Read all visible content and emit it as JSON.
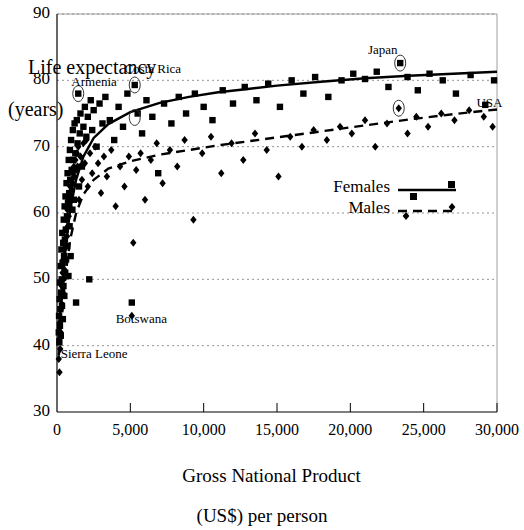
{
  "chart_data": {
    "type": "scatter",
    "title": "",
    "xlabel": "Gross National Product (US$) per person",
    "xlabel_line1": "Gross National Product",
    "xlabel_line2": "(US$) per person",
    "ylabel": "Life expectancy (years)",
    "ylabel_line1": "Life expectancy",
    "ylabel_line2": "(years)",
    "xlim": [
      0,
      30000
    ],
    "ylim": [
      30,
      90
    ],
    "xticks": [
      0,
      5000,
      10000,
      15000,
      20000,
      25000,
      30000
    ],
    "xtick_labels": [
      "0",
      "5,000",
      "10,000",
      "15,000",
      "20,000",
      "25,000",
      "30,000"
    ],
    "yticks": [
      30,
      40,
      50,
      60,
      70,
      80,
      90
    ],
    "ytick_labels": [
      "30",
      "40",
      "50",
      "60",
      "70",
      "80",
      "90"
    ],
    "grid": true,
    "grid_style": "dotted-horizontal",
    "legend_position": "center-right",
    "legend": [
      {
        "name": "Females",
        "marker": "square",
        "line": "solid"
      },
      {
        "name": "Males",
        "marker": "diamond",
        "line": "dashed"
      }
    ],
    "annotations": [
      {
        "label": "Armenia",
        "x": 1450,
        "y": 78.0,
        "circled": true,
        "label_x": 980,
        "label_y": 79.6
      },
      {
        "label": "Costa Rica",
        "x": 5300,
        "y": 79.3,
        "circled": true,
        "label_x": 4600,
        "label_y": 81.6
      },
      {
        "label": "Japan",
        "x": 23400,
        "y": 82.6,
        "circled": true,
        "label_x": 21200,
        "label_y": 84.4
      },
      {
        "label": "USA",
        "x": 29800,
        "y": 76.3,
        "circled": false,
        "label_x": 28600,
        "label_y": 76.5
      },
      {
        "label": "Botswana",
        "x": 5100,
        "y": 46.5,
        "circled": false,
        "label_x": 4000,
        "label_y": 43.8
      },
      {
        "label": "Sierra Leone",
        "x": 300,
        "y": 36.0,
        "circled": false,
        "label_x": 250,
        "label_y": 38.6
      }
    ],
    "series": [
      {
        "name": "Females",
        "marker": "square",
        "line": "solid",
        "color": "#000000",
        "trend": [
          [
            120,
            42.0
          ],
          [
            300,
            47.5
          ],
          [
            600,
            55.0
          ],
          [
            900,
            60.5
          ],
          [
            1300,
            65.0
          ],
          [
            1800,
            68.5
          ],
          [
            2500,
            71.3
          ],
          [
            3500,
            73.4
          ],
          [
            5000,
            75.2
          ],
          [
            7000,
            76.6
          ],
          [
            9000,
            77.5
          ],
          [
            11000,
            78.2
          ],
          [
            13000,
            78.7
          ],
          [
            15000,
            79.2
          ],
          [
            18000,
            79.8
          ],
          [
            21000,
            80.3
          ],
          [
            24000,
            80.7
          ],
          [
            27000,
            81.0
          ],
          [
            30000,
            81.3
          ]
        ],
        "points": [
          [
            120,
            42.0
          ],
          [
            140,
            44.5
          ],
          [
            160,
            40.5
          ],
          [
            180,
            47.0
          ],
          [
            200,
            43.0
          ],
          [
            210,
            49.5
          ],
          [
            230,
            45.5
          ],
          [
            250,
            52.0
          ],
          [
            260,
            41.5
          ],
          [
            280,
            48.0
          ],
          [
            300,
            54.5
          ],
          [
            320,
            50.0
          ],
          [
            340,
            46.0
          ],
          [
            360,
            57.0
          ],
          [
            380,
            52.5
          ],
          [
            400,
            44.0
          ],
          [
            420,
            55.5
          ],
          [
            440,
            49.0
          ],
          [
            460,
            59.0
          ],
          [
            480,
            53.5
          ],
          [
            500,
            47.5
          ],
          [
            520,
            61.0
          ],
          [
            540,
            56.0
          ],
          [
            560,
            51.0
          ],
          [
            580,
            62.5
          ],
          [
            600,
            57.5
          ],
          [
            620,
            53.0
          ],
          [
            650,
            64.5
          ],
          [
            680,
            59.5
          ],
          [
            700,
            55.0
          ],
          [
            720,
            66.0
          ],
          [
            750,
            61.5
          ],
          [
            780,
            50.5
          ],
          [
            800,
            68.0
          ],
          [
            830,
            63.0
          ],
          [
            860,
            58.0
          ],
          [
            880,
            69.5
          ],
          [
            900,
            65.0
          ],
          [
            930,
            53.5
          ],
          [
            960,
            71.0
          ],
          [
            1000,
            66.5
          ],
          [
            1050,
            60.5
          ],
          [
            1080,
            72.5
          ],
          [
            1100,
            68.0
          ],
          [
            1150,
            62.0
          ],
          [
            1200,
            73.5
          ],
          [
            1250,
            69.0
          ],
          [
            1300,
            46.5
          ],
          [
            1350,
            74.0
          ],
          [
            1400,
            70.5
          ],
          [
            1450,
            78.0
          ],
          [
            1500,
            64.0
          ],
          [
            1550,
            72.0
          ],
          [
            1600,
            75.0
          ],
          [
            1700,
            67.0
          ],
          [
            1800,
            73.0
          ],
          [
            1900,
            76.0
          ],
          [
            2000,
            71.5
          ],
          [
            2100,
            74.5
          ],
          [
            2200,
            50.0
          ],
          [
            2300,
            77.0
          ],
          [
            2400,
            72.5
          ],
          [
            2500,
            75.5
          ],
          [
            2700,
            70.0
          ],
          [
            2900,
            76.5
          ],
          [
            3100,
            73.5
          ],
          [
            3300,
            77.5
          ],
          [
            3600,
            74.0
          ],
          [
            3900,
            71.0
          ],
          [
            4200,
            76.0
          ],
          [
            4500,
            73.0
          ],
          [
            4800,
            78.0
          ],
          [
            5100,
            46.5
          ],
          [
            5300,
            79.3
          ],
          [
            5500,
            75.0
          ],
          [
            5800,
            72.0
          ],
          [
            6100,
            77.0
          ],
          [
            6500,
            74.5
          ],
          [
            6900,
            66.0
          ],
          [
            7300,
            76.5
          ],
          [
            7800,
            73.5
          ],
          [
            8300,
            77.5
          ],
          [
            8800,
            75.0
          ],
          [
            9400,
            78.0
          ],
          [
            10000,
            76.0
          ],
          [
            10600,
            74.0
          ],
          [
            11300,
            78.5
          ],
          [
            12000,
            76.5
          ],
          [
            12800,
            79.0
          ],
          [
            13600,
            77.0
          ],
          [
            14400,
            79.5
          ],
          [
            15200,
            76.0
          ],
          [
            16000,
            80.0
          ],
          [
            16800,
            78.0
          ],
          [
            17600,
            80.5
          ],
          [
            18500,
            77.5
          ],
          [
            19400,
            80.0
          ],
          [
            20200,
            81.0
          ],
          [
            21000,
            80.2
          ],
          [
            21800,
            81.3
          ],
          [
            22600,
            79.0
          ],
          [
            23400,
            82.6
          ],
          [
            23900,
            80.5
          ],
          [
            24600,
            78.5
          ],
          [
            25400,
            81.0
          ],
          [
            26300,
            80.0
          ],
          [
            27200,
            78.0
          ],
          [
            28200,
            80.8
          ],
          [
            29200,
            76.3
          ],
          [
            29800,
            80.0
          ]
        ]
      },
      {
        "name": "Males",
        "marker": "diamond",
        "line": "dashed",
        "color": "#000000",
        "trend": [
          [
            120,
            38.5
          ],
          [
            300,
            44.0
          ],
          [
            600,
            51.0
          ],
          [
            900,
            56.0
          ],
          [
            1300,
            60.0
          ],
          [
            1800,
            62.8
          ],
          [
            2500,
            65.0
          ],
          [
            3500,
            66.7
          ],
          [
            5000,
            67.8
          ],
          [
            7000,
            68.8
          ],
          [
            9000,
            69.5
          ],
          [
            11000,
            70.2
          ],
          [
            13000,
            70.8
          ],
          [
            15000,
            71.4
          ],
          [
            18000,
            72.3
          ],
          [
            21000,
            73.2
          ],
          [
            24000,
            74.1
          ],
          [
            27000,
            74.9
          ],
          [
            30000,
            75.6
          ]
        ],
        "points": [
          [
            120,
            38.0
          ],
          [
            150,
            41.0
          ],
          [
            170,
            36.0
          ],
          [
            190,
            43.5
          ],
          [
            220,
            39.5
          ],
          [
            240,
            45.5
          ],
          [
            260,
            42.0
          ],
          [
            280,
            47.5
          ],
          [
            300,
            44.0
          ],
          [
            320,
            49.0
          ],
          [
            350,
            46.0
          ],
          [
            380,
            51.0
          ],
          [
            400,
            48.0
          ],
          [
            430,
            53.0
          ],
          [
            450,
            50.0
          ],
          [
            480,
            54.5
          ],
          [
            500,
            51.5
          ],
          [
            530,
            56.0
          ],
          [
            560,
            53.0
          ],
          [
            590,
            57.5
          ],
          [
            620,
            55.0
          ],
          [
            650,
            59.0
          ],
          [
            680,
            56.5
          ],
          [
            710,
            60.5
          ],
          [
            740,
            58.0
          ],
          [
            770,
            62.0
          ],
          [
            800,
            59.5
          ],
          [
            840,
            63.0
          ],
          [
            870,
            61.0
          ],
          [
            900,
            64.0
          ],
          [
            940,
            62.5
          ],
          [
            980,
            65.0
          ],
          [
            1020,
            63.5
          ],
          [
            1060,
            66.0
          ],
          [
            1100,
            64.5
          ],
          [
            1150,
            67.0
          ],
          [
            1200,
            65.5
          ],
          [
            1250,
            68.0
          ],
          [
            1300,
            66.5
          ],
          [
            1350,
            69.0
          ],
          [
            1400,
            67.0
          ],
          [
            1450,
            70.0
          ],
          [
            1500,
            62.0
          ],
          [
            1600,
            68.5
          ],
          [
            1700,
            65.0
          ],
          [
            1800,
            70.5
          ],
          [
            1900,
            67.5
          ],
          [
            2000,
            71.0
          ],
          [
            2100,
            64.0
          ],
          [
            2250,
            69.0
          ],
          [
            2400,
            66.0
          ],
          [
            2600,
            70.0
          ],
          [
            2800,
            67.5
          ],
          [
            3000,
            63.0
          ],
          [
            3200,
            68.5
          ],
          [
            3400,
            65.5
          ],
          [
            3700,
            69.5
          ],
          [
            4000,
            61.0
          ],
          [
            4300,
            67.0
          ],
          [
            4600,
            64.0
          ],
          [
            4900,
            68.5
          ],
          [
            5100,
            44.5
          ],
          [
            5200,
            55.5
          ],
          [
            5400,
            66.5
          ],
          [
            5700,
            69.0
          ],
          [
            6000,
            62.0
          ],
          [
            6400,
            68.0
          ],
          [
            6800,
            70.5
          ],
          [
            7200,
            64.5
          ],
          [
            7700,
            69.5
          ],
          [
            8200,
            67.0
          ],
          [
            8700,
            71.0
          ],
          [
            9300,
            59.0
          ],
          [
            9900,
            69.0
          ],
          [
            10500,
            71.5
          ],
          [
            11200,
            66.0
          ],
          [
            11900,
            70.5
          ],
          [
            12700,
            68.0
          ],
          [
            13500,
            72.0
          ],
          [
            14300,
            69.5
          ],
          [
            15100,
            65.5
          ],
          [
            15900,
            71.5
          ],
          [
            16700,
            70.0
          ],
          [
            17500,
            72.5
          ],
          [
            18400,
            71.0
          ],
          [
            19300,
            73.0
          ],
          [
            20100,
            72.0
          ],
          [
            21000,
            74.0
          ],
          [
            21700,
            70.0
          ],
          [
            22500,
            73.5
          ],
          [
            23300,
            75.8
          ],
          [
            23900,
            72.0
          ],
          [
            24500,
            74.5
          ],
          [
            25300,
            73.0
          ],
          [
            26200,
            75.0
          ],
          [
            27100,
            74.0
          ],
          [
            28100,
            75.5
          ],
          [
            29100,
            74.5
          ],
          [
            29700,
            73.0
          ]
        ]
      }
    ]
  },
  "axis_geometry": {
    "plot_left": 57,
    "plot_right": 497,
    "plot_top": 14,
    "plot_bottom": 412
  }
}
